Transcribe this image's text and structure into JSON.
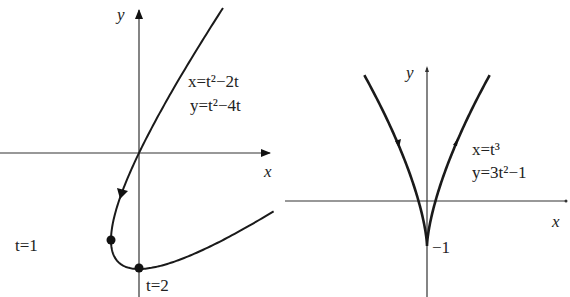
{
  "chart_data": [
    {
      "type": "line",
      "title": "",
      "xlabel": "x",
      "ylabel": "y",
      "equations": [
        "x=t^2-2t",
        "y=t^2-4t"
      ],
      "parameter_range": [
        -1,
        3.41
      ],
      "points": [
        {
          "t": -1,
          "x": 3,
          "y": 5
        },
        {
          "t": 0,
          "x": 0,
          "y": 0
        },
        {
          "t": 1,
          "x": -1,
          "y": -3,
          "marked": true,
          "label": "t=1"
        },
        {
          "t": 2,
          "x": 0,
          "y": -4,
          "marked": true,
          "label": "t=2"
        },
        {
          "t": 3,
          "x": 3,
          "y": -3
        },
        {
          "t": 3.41,
          "x": 4.83,
          "y": -2
        }
      ],
      "direction": "decreasing y toward t=1 (arrow on curve pointing down-left)",
      "grid": false
    },
    {
      "type": "line",
      "title": "",
      "xlabel": "x",
      "ylabel": "y",
      "equations": [
        "x=t^3",
        "y=3t^2-1"
      ],
      "parameter_range": [
        -1.125,
        1.125
      ],
      "points": [
        {
          "t": -1.125,
          "x": -1.42,
          "y": 2.8
        },
        {
          "t": -0.577,
          "x": -0.19,
          "y": 0
        },
        {
          "t": 0,
          "x": 0,
          "y": -1,
          "label": "-1"
        },
        {
          "t": 0.577,
          "x": 0.19,
          "y": 0
        },
        {
          "t": 1.125,
          "x": 1.42,
          "y": 2.8
        }
      ],
      "annotations": [
        "-1"
      ],
      "direction": "arrows on both branches: left branch downward, right branch upward",
      "grid": false
    }
  ],
  "left": {
    "eq1": "x=t²−2t",
    "eq2": "y=t²−4t",
    "axis_x": "x",
    "axis_y": "y",
    "t1_label": "t=1",
    "t2_label": "t=2"
  },
  "right": {
    "eq1": "x=t³",
    "eq2": "y=3t²−1",
    "axis_x": "x",
    "axis_y": "y",
    "tick_label": "−1"
  }
}
